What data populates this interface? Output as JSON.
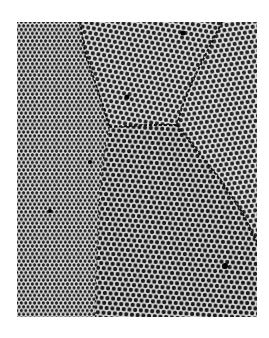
{
  "figure": {
    "type": "micrograph",
    "colors": {
      "background": "#ffffff",
      "lattice_dot": "#1e1e1e",
      "lattice_bg": "#e0e0e0",
      "boundary": "#111111"
    },
    "grains": [
      {
        "id": "left-grain",
        "region": "left side, full height"
      },
      {
        "id": "top-center-grain",
        "region": "top center, bounded below at y~125"
      },
      {
        "id": "right-grain",
        "region": "right side"
      },
      {
        "id": "bottom-center-grain",
        "region": "bottom center"
      }
    ],
    "defects": [
      {
        "x": 127,
        "y": 97
      },
      {
        "x": 183,
        "y": 33
      },
      {
        "x": 90,
        "y": 162
      },
      {
        "x": 225,
        "y": 266
      },
      {
        "x": 50,
        "y": 211
      }
    ]
  }
}
